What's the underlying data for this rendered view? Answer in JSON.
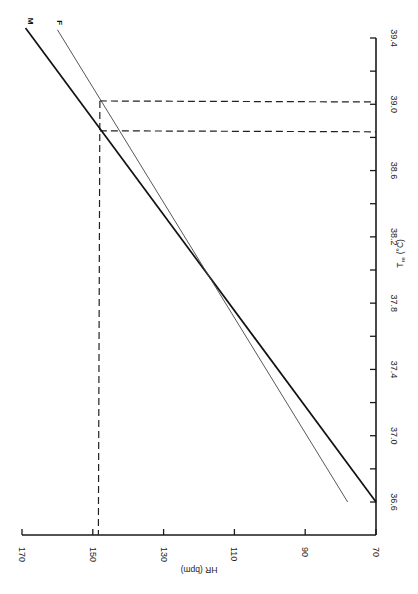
{
  "chart_data": {
    "type": "line",
    "orientation_note_visible": "figure rotated 90 degrees: HR axis runs along bottom (reversed), T_re axis runs along right side",
    "title": "",
    "xlabel": "T_re (°C)",
    "xlabel_main": "T",
    "xlabel_sub": "re",
    "xlabel_unit": "(°C)",
    "ylabel": "HR (bpm)",
    "xlim": [
      36.6,
      39.4
    ],
    "ylim": [
      70,
      170
    ],
    "x_ticks": [
      36.6,
      36.8,
      37.0,
      37.2,
      37.4,
      37.6,
      37.8,
      38.0,
      38.2,
      38.4,
      38.6,
      38.8,
      39.0,
      39.2,
      39.4
    ],
    "x_tick_labels": [
      {
        "value": 36.6,
        "label": "36.6"
      },
      {
        "value": 37.0,
        "label": "37.0"
      },
      {
        "value": 37.4,
        "label": "37.4"
      },
      {
        "value": 37.8,
        "label": "37.8"
      },
      {
        "value": 38.2,
        "label": "38.2"
      },
      {
        "value": 38.6,
        "label": "38.6"
      },
      {
        "value": 39.0,
        "label": "39.0"
      },
      {
        "value": 39.4,
        "label": "39.4"
      }
    ],
    "y_ticks": [
      170,
      150,
      130,
      110,
      90,
      70
    ],
    "y_tick_labels": [
      {
        "value": 170,
        "label": "170"
      },
      {
        "value": 150,
        "label": "150"
      },
      {
        "value": 130,
        "label": "130"
      },
      {
        "value": 110,
        "label": "110"
      },
      {
        "value": 90,
        "label": "90"
      },
      {
        "value": 70,
        "label": "70"
      }
    ],
    "grid": false,
    "legend": "inline labels at line ends",
    "series": [
      {
        "name": "M",
        "label": "M",
        "style": "thick solid",
        "x": [
          36.6,
          39.46
        ],
        "y": [
          70,
          169
        ]
      },
      {
        "name": "F",
        "label": "F",
        "style": "thin solid",
        "x": [
          36.6,
          39.45
        ],
        "y": [
          78,
          160
        ]
      }
    ],
    "reference_lines": [
      {
        "type": "vertical_in_hr",
        "hr": 148,
        "from_t": 36.5,
        "to_t": 39.02,
        "style": "dashed"
      },
      {
        "type": "horizontal_in_t",
        "t": 39.02,
        "from_hr": 148,
        "to_hr": 70,
        "style": "dashed",
        "series": "F"
      },
      {
        "type": "horizontal_in_t",
        "t": 38.84,
        "from_hr": 148,
        "to_hr": 70,
        "style": "dashed",
        "series": "M"
      }
    ],
    "annotations": [
      {
        "text": "M",
        "at": "upper end of thick line"
      },
      {
        "text": "F",
        "at": "upper end of thin line"
      }
    ]
  },
  "layout": {
    "hr_axis": {
      "y": 535,
      "x_at_170": 22,
      "x_at_70": 376
    },
    "t_axis": {
      "x": 376,
      "y_at_36_6": 502,
      "y_at_39_4": 38,
      "y_bottom": 535
    }
  }
}
